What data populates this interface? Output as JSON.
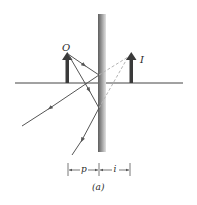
{
  "figure": {
    "caption": "(a)",
    "labels": {
      "object": "O",
      "image": "I",
      "object_distance": "p",
      "image_distance": "i"
    },
    "colors": {
      "object_arrow": "#3a3a3a",
      "rays": "#555555",
      "dashed_extensions": "#b0b0b0",
      "mirror_dark": "#6a6a6a",
      "mirror_light": "#d8d8d8",
      "axis": "#444444"
    }
  }
}
